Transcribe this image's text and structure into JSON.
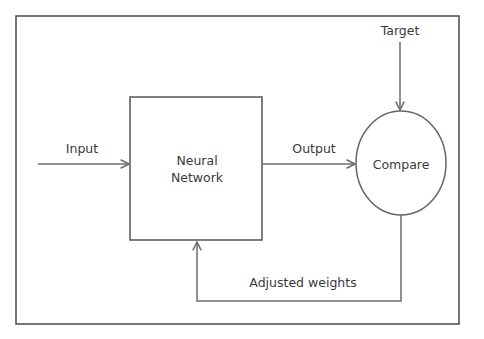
{
  "diagram": {
    "title": "",
    "nodes": [
      {
        "id": "nn",
        "label_line1": "Neural",
        "label_line2": "Network",
        "shape": "rectangle"
      },
      {
        "id": "compare",
        "label": "Compare",
        "shape": "ellipse"
      }
    ],
    "edges": [
      {
        "from": "input",
        "to": "nn",
        "label": "Input"
      },
      {
        "from": "nn",
        "to": "compare",
        "label": "Output"
      },
      {
        "from": "target",
        "to": "compare",
        "label": "Target"
      },
      {
        "from": "compare",
        "to": "nn",
        "label": "Adjusted weights"
      }
    ],
    "colors": {
      "line": "#6e6e6e",
      "frame": "#4a4a4a",
      "text": "#3a3a3a"
    }
  }
}
